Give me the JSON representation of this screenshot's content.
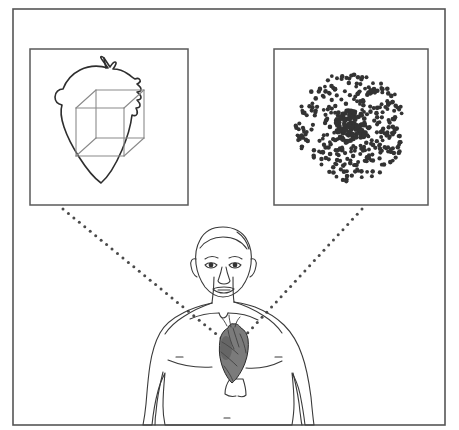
{
  "figure": {
    "title": "Multiscale cardiac modeling schematic",
    "description": "A framed schematic showing a human torso with an anatomical heart, connected by dotted leader lines to two inset panels: a heart outline with a wireframe cube (computational mesh element) and a scatter cloud of cell points.",
    "background_color": "#ffffff",
    "line_color": "#3c3c3c",
    "frame": {
      "name": "outer-frame",
      "x": 13,
      "y": 9,
      "width": 432,
      "height": 416,
      "stroke": "#555555",
      "stroke_width": 1.6
    }
  },
  "panels": [
    {
      "id": "left-panel",
      "name": "heart-cube-panel",
      "label": "Heart outline with wireframe cube",
      "x": 30,
      "y": 49,
      "width": 158,
      "height": 156,
      "stroke": "#5a5a5a",
      "stroke_width": 1.5,
      "content": {
        "type": "heart-outline-with-cube",
        "outline_stroke": "#2e2e2e",
        "cube_stroke": "#8a8a8a",
        "cube_front": {
          "x": 76,
          "y": 108,
          "size": 48
        },
        "cube_depth_dx": 20,
        "cube_depth_dy": -18
      }
    },
    {
      "id": "right-panel",
      "name": "cell-cloud-panel",
      "label": "Dense radial cloud of cell points",
      "x": 274,
      "y": 49,
      "width": 154,
      "height": 156,
      "stroke": "#5a5a5a",
      "stroke_width": 1.5,
      "content": {
        "type": "radial-dot-cloud",
        "center_x": 351,
        "center_y": 127,
        "outer_radius": 55,
        "core_radius": 13,
        "dot_color": "#333333",
        "dot_radius": 2.1,
        "dot_count": 320,
        "core_dot_count": 110
      }
    }
  ],
  "connectors": [
    {
      "id": "left-connector",
      "name": "dotted-leader-left",
      "from_x": 63,
      "from_y": 209,
      "to_x": 221,
      "to_y": 338,
      "style": "dotted",
      "color": "#4a4a4a",
      "dot_radius": 1.5,
      "spacing": 7
    },
    {
      "id": "right-connector",
      "name": "dotted-leader-right",
      "from_x": 362,
      "from_y": 209,
      "to_x": 243,
      "to_y": 338,
      "style": "dotted",
      "color": "#4a4a4a",
      "dot_radius": 1.5,
      "spacing": 7
    }
  ],
  "body": {
    "name": "human-torso-figure",
    "label": "Front view of a male human head and torso",
    "stroke": "#3a3a3a",
    "stroke_width": 1.1,
    "parts": [
      {
        "name": "head",
        "label": "Head"
      },
      {
        "name": "left-ear",
        "label": "Left ear"
      },
      {
        "name": "right-ear",
        "label": "Right ear"
      },
      {
        "name": "left-eye",
        "label": "Left eye"
      },
      {
        "name": "right-eye",
        "label": "Right eye"
      },
      {
        "name": "nose",
        "label": "Nose"
      },
      {
        "name": "mouth",
        "label": "Mouth"
      },
      {
        "name": "neck",
        "label": "Neck"
      },
      {
        "name": "clavicles",
        "label": "Clavicles"
      },
      {
        "name": "left-shoulder",
        "label": "Left shoulder"
      },
      {
        "name": "right-shoulder",
        "label": "Right shoulder"
      },
      {
        "name": "left-arm",
        "label": "Left arm"
      },
      {
        "name": "right-arm",
        "label": "Right arm"
      },
      {
        "name": "chest",
        "label": "Chest"
      },
      {
        "name": "navel",
        "label": "Navel"
      },
      {
        "name": "ribcage-marking",
        "label": "Lower ribcage marking"
      }
    ],
    "heart": {
      "name": "anatomical-heart",
      "label": "Anatomical heart on chest",
      "center_x": 232,
      "center_y": 355,
      "fill": "#6e6e6e",
      "stroke": "#2a2a2a"
    }
  }
}
